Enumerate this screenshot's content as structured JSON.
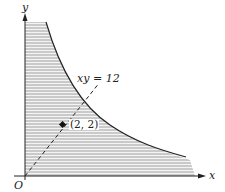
{
  "diagram": {
    "title": "",
    "curve_label": "xy = 12",
    "point_label": "(2, 2)",
    "origin_label": "O",
    "x_axis_label": "x",
    "y_axis_label": "y",
    "colors": {
      "background": "#ffffff",
      "hatch": "#8a8a8a",
      "curve": "#222222",
      "axis": "#222222"
    }
  }
}
